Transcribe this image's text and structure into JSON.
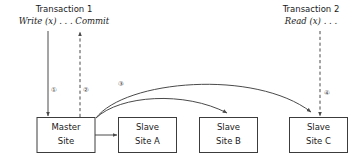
{
  "figure": {
    "background_color": "#ffffff",
    "stroke_color": "#4a4a4a",
    "text_color": "#1a1a1a"
  },
  "transactions": [
    {
      "id": "transaction-1",
      "title": "Transaction 1",
      "operation": "Write (x) . . . Commit"
    },
    {
      "id": "transaction-2",
      "title": "Transaction 2",
      "operation": "Read (x) . . ."
    }
  ],
  "nodes": [
    {
      "id": "master-site",
      "line1": "Master",
      "line2": "Site"
    },
    {
      "id": "slave-site-a",
      "line1": "Slave",
      "line2": "Site A"
    },
    {
      "id": "slave-site-b",
      "line1": "Slave",
      "line2": "Site B"
    },
    {
      "id": "slave-site-c",
      "line1": "Slave",
      "line2": "Site C"
    }
  ],
  "steps": [
    {
      "id": "step-1",
      "label": "①",
      "description": "Write arrives at Master Site",
      "style": "solid"
    },
    {
      "id": "step-2",
      "label": "②",
      "description": "Commit acknowledged back to Transaction 1",
      "style": "dashed"
    },
    {
      "id": "step-3",
      "label": "③",
      "description": "Master Site propagates update to slave sites",
      "style": "solid"
    },
    {
      "id": "step-4",
      "label": "④",
      "description": "Read issued at Slave Site C",
      "style": "dashed"
    }
  ]
}
